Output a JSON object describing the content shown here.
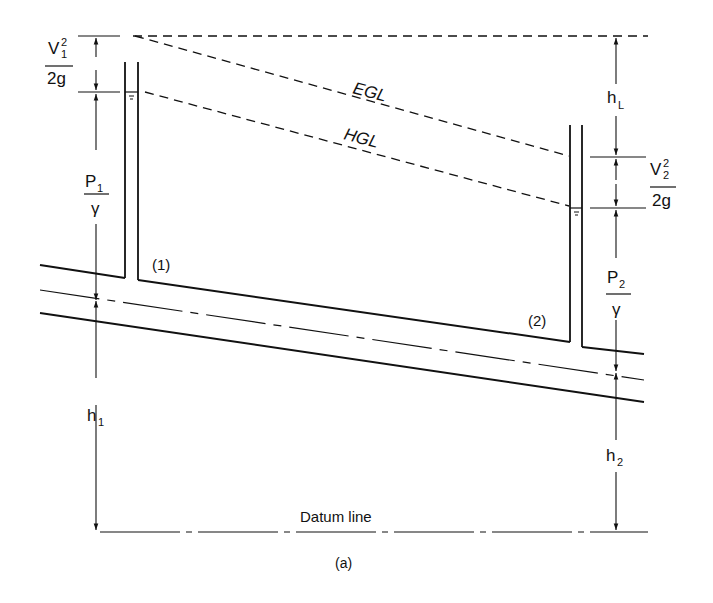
{
  "figure": {
    "caption": "(a)",
    "line_color": "#111111",
    "background": "#ffffff"
  },
  "lines": {
    "egl": "EGL",
    "hgl": "HGL",
    "datum": "Datum line"
  },
  "sections": {
    "s1": "(1)",
    "s2": "(2)"
  },
  "labels": {
    "v1_num": "V",
    "v1_sup": "2",
    "v1_sub": "1",
    "v1_den": "2g",
    "p1_num": "P",
    "p1_sub": "1",
    "p1_den": "γ",
    "h1": "h",
    "h1_sub": "1",
    "hl": "h",
    "hl_sub": "L",
    "v2_num": "V",
    "v2_sup": "2",
    "v2_sub": "2",
    "v2_den": "2g",
    "p2_num": "P",
    "p2_sub": "2",
    "p2_den": "γ",
    "h2": "h",
    "h2_sub": "2"
  }
}
